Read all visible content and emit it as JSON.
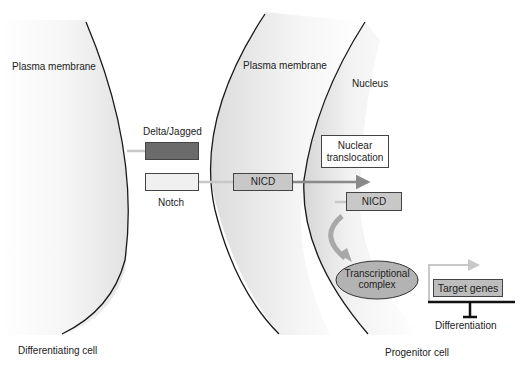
{
  "diagram": {
    "labels": {
      "plasma_membrane_left": "Plasma membrane",
      "plasma_membrane_right": "Plasma membrane",
      "nucleus": "Nucleus",
      "delta_jagged": "Delta/Jagged",
      "notch": "Notch",
      "nicd_membrane": "NICD",
      "nuclear_translocation_line1": "Nuclear",
      "nuclear_translocation_line2": "translocation",
      "nicd_nucleus": "NICD",
      "transcriptional_line1": "Transcriptional",
      "transcriptional_line2": "complex",
      "target_genes": "Target genes",
      "differentiation": "Differentiation",
      "differentiating_cell": "Differentiating cell",
      "progenitor_cell": "Progenitor cell"
    },
    "colors": {
      "delta_jagged_fill": "#6b6b6b",
      "notch_fill": "#f0f0f0",
      "nicd_fill": "#c8c8c8",
      "complex_fill": "#b3b3b3",
      "target_genes_fill": "#bdbdbd",
      "arrow_gray": "#8a8a8a",
      "connector_light": "#c8c8c8",
      "membrane_line": "#1a1a1a"
    }
  }
}
